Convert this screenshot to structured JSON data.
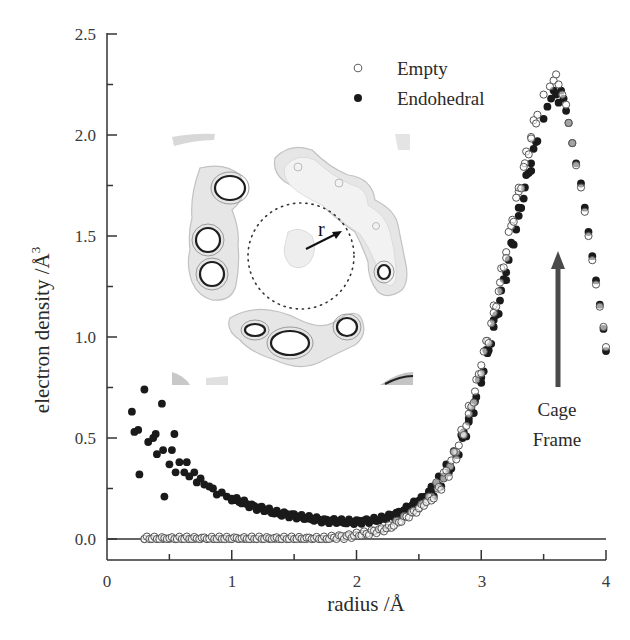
{
  "chart_data": {
    "type": "scatter",
    "title": "",
    "xlabel": "radius /Å",
    "ylabel": "electron density /Å",
    "ylabel_superscript": "3",
    "xlim": [
      0,
      4
    ],
    "ylim": [
      -0.1,
      2.5
    ],
    "x_ticks": [
      "0",
      "1",
      "2",
      "3",
      "4"
    ],
    "y_ticks": [
      "0.0",
      "0.5",
      "1.0",
      "1.5",
      "2.0",
      "2.5"
    ],
    "grid": false,
    "zero_line": true,
    "legend_position": "upper center-right",
    "legend": [
      "Empty",
      "Endohedral"
    ],
    "annotations": [
      {
        "text": "Cage\nFrame",
        "type": "arrow-up",
        "x": 3.62,
        "y_from": 0.75,
        "y_to": 1.42
      },
      {
        "text": "r",
        "type": "inset-label"
      }
    ],
    "inset": {
      "description": "Contour map of cage cross-section with dotted circle of radius r around center",
      "label": "r"
    },
    "series": [
      {
        "name": "Empty",
        "marker": "open-circle",
        "x": [
          0.3,
          0.35,
          0.4,
          0.45,
          0.5,
          0.55,
          0.6,
          0.65,
          0.7,
          0.75,
          0.8,
          0.85,
          0.9,
          0.95,
          1.0,
          1.05,
          1.1,
          1.15,
          1.2,
          1.25,
          1.3,
          1.35,
          1.4,
          1.45,
          1.5,
          1.55,
          1.6,
          1.65,
          1.7,
          1.75,
          1.8,
          1.85,
          1.9,
          1.95,
          2.0,
          2.05,
          2.1,
          2.15,
          2.2,
          2.25,
          2.3,
          2.35,
          2.4,
          2.45,
          2.5,
          2.55,
          2.6,
          2.65,
          2.7,
          2.75,
          2.8,
          2.85,
          2.9,
          2.95,
          3.0,
          3.05,
          3.1,
          3.15,
          3.2,
          3.25,
          3.3,
          3.35,
          3.4,
          3.45,
          3.5,
          3.55,
          3.58,
          3.6,
          3.62,
          3.65,
          3.68,
          3.7,
          3.73,
          3.76,
          3.8,
          3.83,
          3.86,
          3.89,
          3.92,
          3.95,
          3.98,
          4.0
        ],
        "y": [
          0.0,
          0.0,
          0.0,
          0.0,
          0.0,
          0.0,
          0.0,
          0.0,
          0.0,
          0.0,
          0.0,
          0.0,
          0.0,
          0.0,
          0.0,
          0.0,
          0.0,
          0.0,
          0.0,
          0.0,
          0.0,
          0.0,
          0.0,
          0.0,
          0.0,
          0.0,
          0.0,
          0.0,
          0.0,
          0.0,
          0.005,
          0.01,
          0.01,
          0.015,
          0.02,
          0.025,
          0.03,
          0.04,
          0.045,
          0.055,
          0.07,
          0.09,
          0.11,
          0.13,
          0.15,
          0.18,
          0.21,
          0.25,
          0.3,
          0.36,
          0.43,
          0.52,
          0.62,
          0.73,
          0.86,
          0.98,
          1.12,
          1.27,
          1.42,
          1.58,
          1.72,
          1.86,
          1.99,
          2.1,
          2.2,
          2.24,
          2.27,
          2.3,
          2.25,
          2.2,
          2.15,
          2.06,
          1.96,
          1.85,
          1.74,
          1.62,
          1.5,
          1.38,
          1.26,
          1.15,
          1.05,
          0.95
        ]
      },
      {
        "name": "Endohedral",
        "marker": "filled-circle",
        "x": [
          0.2,
          0.22,
          0.25,
          0.26,
          0.3,
          0.33,
          0.37,
          0.39,
          0.4,
          0.44,
          0.45,
          0.46,
          0.5,
          0.52,
          0.54,
          0.55,
          0.58,
          0.62,
          0.64,
          0.66,
          0.7,
          0.72,
          0.75,
          0.78,
          0.82,
          0.85,
          0.88,
          0.92,
          0.96,
          1.0,
          1.05,
          1.1,
          1.15,
          1.2,
          1.25,
          1.3,
          1.35,
          1.4,
          1.45,
          1.5,
          1.55,
          1.6,
          1.65,
          1.7,
          1.75,
          1.8,
          1.85,
          1.9,
          1.95,
          2.0,
          2.05,
          2.1,
          2.15,
          2.2,
          2.25,
          2.3,
          2.35,
          2.4,
          2.45,
          2.5,
          2.55,
          2.6,
          2.65,
          2.7,
          2.75,
          2.8,
          2.85,
          2.9,
          2.95,
          3.0,
          3.05,
          3.1,
          3.15,
          3.2,
          3.25,
          3.3,
          3.35,
          3.4,
          3.45,
          3.5,
          3.53,
          3.56,
          3.58,
          3.6,
          3.62,
          3.64,
          3.66,
          3.68,
          3.7,
          3.73,
          3.76,
          3.8,
          3.83,
          3.86,
          3.89,
          3.92,
          3.95,
          3.98,
          4.0
        ],
        "y": [
          0.63,
          0.53,
          0.54,
          0.32,
          0.74,
          0.48,
          0.5,
          0.52,
          0.42,
          0.67,
          0.44,
          0.21,
          0.37,
          0.44,
          0.52,
          0.33,
          0.38,
          0.33,
          0.38,
          0.31,
          0.33,
          0.28,
          0.3,
          0.27,
          0.26,
          0.25,
          0.22,
          0.23,
          0.21,
          0.2,
          0.19,
          0.18,
          0.165,
          0.155,
          0.15,
          0.14,
          0.13,
          0.125,
          0.12,
          0.115,
          0.11,
          0.105,
          0.1,
          0.095,
          0.09,
          0.09,
          0.088,
          0.085,
          0.085,
          0.085,
          0.088,
          0.09,
          0.095,
          0.1,
          0.11,
          0.12,
          0.13,
          0.15,
          0.17,
          0.19,
          0.21,
          0.24,
          0.27,
          0.31,
          0.36,
          0.42,
          0.5,
          0.58,
          0.68,
          0.8,
          0.92,
          1.05,
          1.18,
          1.32,
          1.46,
          1.6,
          1.74,
          1.86,
          1.97,
          2.08,
          2.14,
          2.18,
          2.22,
          2.2,
          2.16,
          2.22,
          2.18,
          2.12,
          2.06,
          1.96,
          1.86,
          1.76,
          1.64,
          1.52,
          1.4,
          1.28,
          1.16,
          1.04,
          0.93
        ]
      }
    ]
  },
  "axes": {
    "x_title": "radius /Å",
    "y_title": "electron density /Å",
    "y_title_sup": "3",
    "x_ticks": [
      "0",
      "1",
      "2",
      "3",
      "4"
    ],
    "y_ticks": [
      "0.0",
      "0.5",
      "1.0",
      "1.5",
      "2.0",
      "2.5"
    ]
  },
  "legend": {
    "empty_label": "Empty",
    "endohedral_label": "Endohedral"
  },
  "annotations": {
    "cage_line1": "Cage",
    "cage_line2": "Frame",
    "inset_r_label": "r"
  },
  "colors": {
    "axis": "#333333",
    "marker_filled": "#1a1a1a",
    "marker_open_stroke": "#555555",
    "arrow": "#4a4a4a",
    "contour_dark": "#222222",
    "contour_light": "#bdbdbd"
  }
}
